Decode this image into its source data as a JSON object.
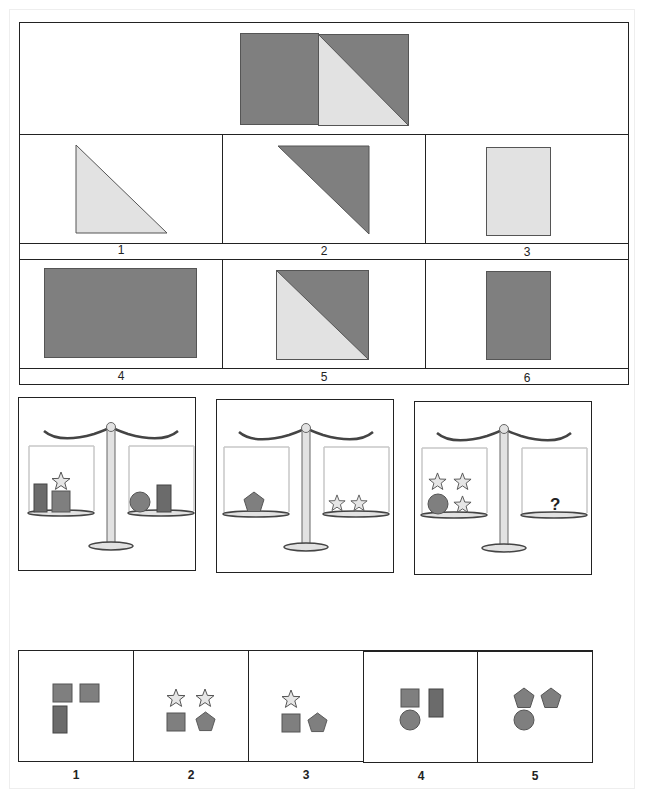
{
  "colors": {
    "dark_gray": "#7f7f7f",
    "darker_gray": "#6b6b6b",
    "light_gray": "#e2e2e2",
    "border": "#222222"
  },
  "puzzle1": {
    "question_figure": "dark-square-plus-split-square",
    "options": [
      {
        "label": "1",
        "shape": "light-triangle"
      },
      {
        "label": "2",
        "shape": "dark-triangle"
      },
      {
        "label": "3",
        "shape": "light-rectangle"
      },
      {
        "label": "4",
        "shape": "dark-wide-rectangle"
      },
      {
        "label": "5",
        "shape": "split-square-light-dark"
      },
      {
        "label": "6",
        "shape": "dark-rectangle"
      }
    ]
  },
  "puzzle2": {
    "scales": [
      {
        "left": [
          "tall-rectangle",
          "square",
          "star"
        ],
        "right": [
          "circle",
          "tall-rectangle"
        ]
      },
      {
        "left": [
          "pentagon"
        ],
        "right": [
          "star",
          "star"
        ]
      },
      {
        "left": [
          "star",
          "star",
          "circle",
          "star"
        ],
        "right": [],
        "unknown": "?"
      }
    ],
    "options": [
      {
        "label": "1",
        "items": [
          "square",
          "square",
          "tall-rectangle"
        ]
      },
      {
        "label": "2",
        "items": [
          "star",
          "star",
          "square",
          "pentagon"
        ]
      },
      {
        "label": "3",
        "items": [
          "star",
          "square",
          "pentagon"
        ]
      },
      {
        "label": "4",
        "items": [
          "square",
          "tall-rectangle",
          "circle"
        ]
      },
      {
        "label": "5",
        "items": [
          "pentagon",
          "pentagon",
          "circle"
        ]
      }
    ]
  }
}
